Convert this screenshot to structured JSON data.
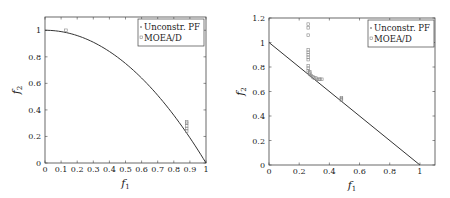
{
  "chart_data": [
    {
      "type": "scatter",
      "title": "",
      "xlabel": "f1",
      "ylabel": "f2",
      "xlim": [
        0,
        1
      ],
      "ylim": [
        0,
        1.1
      ],
      "xticks": [
        "0",
        "0.1",
        "0.2",
        "0.3",
        "0.4",
        "0.5",
        "0.6",
        "0.7",
        "0.8",
        "0.9",
        "1"
      ],
      "yticks": [
        "0",
        "0.2",
        "0.4",
        "0.6",
        "0.8",
        "1"
      ],
      "grid": false,
      "legend_position": "upper right",
      "legend": [
        "Unconstr. PF",
        "MOEA/D"
      ],
      "series": [
        {
          "name": "Unconstr. PF",
          "style": "line",
          "color": "#333333",
          "description": "f2 = 1 - f1^2 (concave)",
          "x": [
            0,
            0.1,
            0.2,
            0.3,
            0.4,
            0.5,
            0.6,
            0.7,
            0.8,
            0.9,
            1.0
          ],
          "y": [
            1,
            0.99,
            0.96,
            0.91,
            0.84,
            0.75,
            0.64,
            0.51,
            0.36,
            0.19,
            0
          ]
        },
        {
          "name": "MOEA/D",
          "style": "markers",
          "color": "#888888",
          "x": [
            0.13,
            0.88,
            0.88,
            0.88,
            0.88,
            0.88
          ],
          "y": [
            1.0,
            0.24,
            0.26,
            0.28,
            0.3,
            0.31
          ]
        }
      ]
    },
    {
      "type": "scatter",
      "title": "",
      "xlabel": "f1",
      "ylabel": "f2",
      "xlim": [
        0,
        1.1
      ],
      "ylim": [
        0,
        1.2
      ],
      "xticks": [
        "0",
        "0.2",
        "0.4",
        "0.6",
        "0.8",
        "1"
      ],
      "yticks": [
        "0",
        "0.2",
        "0.4",
        "0.6",
        "0.8",
        "1",
        "1.2"
      ],
      "grid": false,
      "legend_position": "upper right",
      "legend": [
        "Unconstr. PF",
        "MOEA/D"
      ],
      "series": [
        {
          "name": "Unconstr. PF",
          "style": "line",
          "color": "#333333",
          "description": "f2 = 1 - f1 (linear)",
          "x": [
            0,
            1
          ],
          "y": [
            1,
            0
          ]
        },
        {
          "name": "MOEA/D",
          "style": "markers",
          "color": "#888888",
          "x": [
            0.26,
            0.26,
            0.26,
            0.26,
            0.26,
            0.26,
            0.26,
            0.26,
            0.26,
            0.26,
            0.26,
            0.27,
            0.27,
            0.27,
            0.28,
            0.29,
            0.3,
            0.31,
            0.32,
            0.33,
            0.34,
            0.35,
            0.48,
            0.48,
            0.48
          ],
          "y": [
            1.15,
            1.12,
            1.06,
            0.94,
            0.92,
            0.9,
            0.88,
            0.86,
            0.81,
            0.79,
            0.77,
            0.76,
            0.75,
            0.74,
            0.73,
            0.72,
            0.71,
            0.71,
            0.7,
            0.7,
            0.7,
            0.7,
            0.54,
            0.55,
            0.53
          ]
        }
      ]
    }
  ],
  "labels": {
    "legend_pf": "Unconstr. PF",
    "legend_moead": "MOEA/D",
    "f": "f",
    "sub1": "1",
    "sub2": "2"
  }
}
